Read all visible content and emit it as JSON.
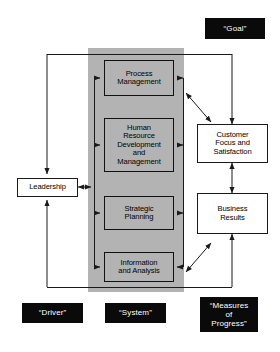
{
  "diagram": {
    "panel": {
      "name": "system-panel",
      "fill": "#b3b3b3"
    },
    "system_nodes": [
      {
        "id": "process-management",
        "label": "Process\nManagement"
      },
      {
        "id": "human-resource-development-and-management",
        "label": "Human\nResource\nDevelopment\nand\nManagement"
      },
      {
        "id": "strategic-planning",
        "label": "Strategic\nPlanning"
      },
      {
        "id": "information-and-analysis",
        "label": "Information\nand Analysis"
      }
    ],
    "driver_nodes": [
      {
        "id": "leadership",
        "label": "Leadership"
      }
    ],
    "result_nodes": [
      {
        "id": "customer-focus-and-satisfaction",
        "label": "Customer\nFocus and\nSatisfaction"
      },
      {
        "id": "business-results",
        "label": "Business\nResults"
      }
    ],
    "tags": [
      {
        "id": "goal",
        "label": "“Goal”"
      },
      {
        "id": "driver",
        "label": "“Driver”"
      },
      {
        "id": "system",
        "label": "“System”"
      },
      {
        "id": "measures-of-progress",
        "label": "“Measures\nof\nProgress”"
      }
    ],
    "colors": {
      "line": "#1a1a1a",
      "panel": "#b3b3b3",
      "tag_background": "#0a0a0a",
      "tag_text": "#ffffff",
      "node_background": "#ffffff",
      "page_background": "#ffffff"
    }
  }
}
